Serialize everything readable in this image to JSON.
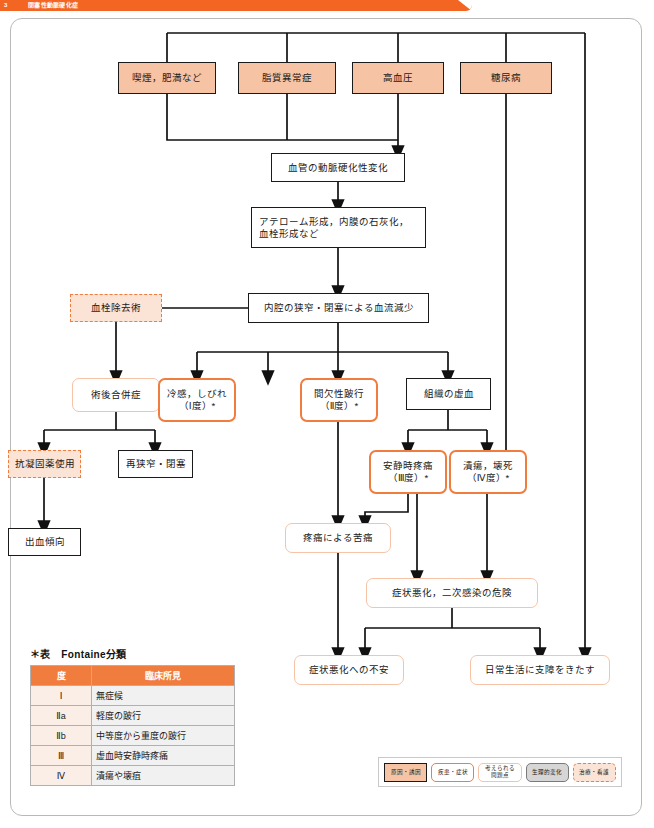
{
  "banner": {
    "number": "3",
    "title": "閉塞性動脈硬化症"
  },
  "nodes": {
    "smoking_obesity": "喫煙，肥満など",
    "dyslipidemia": "脂質異常症",
    "hypertension": "高血圧",
    "diabetes": "糖尿病",
    "arteriosclerotic_change": "血管の動脈硬化性変化",
    "atheroma": "アテローム形成，内膜の石灰化，\n血栓形成など",
    "blood_flow_decrease": "内腔の狭窄・閉塞による血流減少",
    "thrombectomy": "血栓除去術",
    "postop_complication": "術後合併症",
    "coldness_numbness": "冷感，しびれ\n（Ⅰ度）*",
    "intermittent_claudication": "間欠性跛行\n（Ⅱ度）*",
    "tissue_ischemia": "組織の虚血",
    "anticoagulant_use": "抗凝固薬使用",
    "restenosis_occlusion": "再狭窄・閉塞",
    "rest_pain": "安静時疼痛\n（Ⅲ度）*",
    "ulcer_necrosis": "潰瘍，壊死\n（Ⅳ度）*",
    "bleeding_tendency": "出血傾向",
    "pain_distress": "疼痛による苦痛",
    "worsening_infection": "症状悪化，二次感染の危険",
    "anxiety_worsening": "症状悪化への不安",
    "daily_life_impairment": "日常生活に支障をきたす"
  },
  "fontaine": {
    "caption": "＊表　Fontaine分類",
    "headers": [
      "度",
      "臨床所見"
    ],
    "rows": [
      {
        "degree": "Ⅰ",
        "finding": "無症候"
      },
      {
        "degree": "Ⅱa",
        "finding": "軽度の跛行"
      },
      {
        "degree": "Ⅱb",
        "finding": "中等度から重度の跛行"
      },
      {
        "degree": "Ⅲ",
        "finding": "虚血時安静時疼痛"
      },
      {
        "degree": "Ⅳ",
        "finding": "潰瘍や壊疽"
      }
    ]
  },
  "legend": {
    "items": [
      {
        "label": "原因・誘因"
      },
      {
        "label": "疾患・症状"
      },
      {
        "label": "考えられる\n問題点"
      },
      {
        "label": "生理的変化"
      },
      {
        "label": "治療・看護"
      }
    ]
  },
  "colors": {
    "banner": "#F26522",
    "cause_fill": "#F6C4A4",
    "symptom_border": "#F07C3E",
    "problem_border": "#F7C3A6",
    "treatment_fill": "#FBE3D6",
    "table_header": "#F07C3E"
  }
}
